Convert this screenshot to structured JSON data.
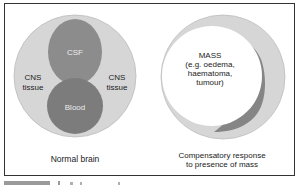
{
  "colors": {
    "frame": "#333333",
    "tissue": "#d6d6d6",
    "csf": "#8c8c8c",
    "blood": "#7c7c7c",
    "mass": "#ffffff",
    "crescent": "#858585",
    "text": "#222222",
    "text_on_dark": "#ececec"
  },
  "left_panel": {
    "csf_label": "CSF",
    "blood_label": "Blood",
    "tissue_left_line1": "CNS",
    "tissue_left_line2": "tissue",
    "tissue_right_line1": "CNS",
    "tissue_right_line2": "tissue",
    "caption": "Normal brain"
  },
  "right_panel": {
    "mass_line1": "MASS",
    "mass_line2": "(e.g. oedema,",
    "mass_line3": "haematoma,",
    "mass_line4": "tumour)",
    "caption_line1": "Compensatory response",
    "caption_line2": "to presence of mass"
  }
}
